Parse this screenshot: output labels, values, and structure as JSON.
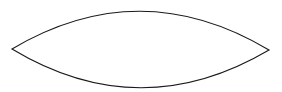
{
  "diagram": {
    "shape": "lens",
    "background": "#ffffff",
    "stroke_color": "#1a1a1a",
    "fill_color": "#ffffff",
    "stroke_width": 1.1,
    "left_tip": [
      12,
      49
    ],
    "right_tip": [
      269,
      50
    ],
    "top_control": [
      140,
      -27
    ],
    "bottom_control": [
      140,
      126
    ]
  }
}
